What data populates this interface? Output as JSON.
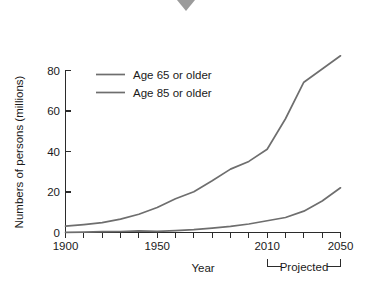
{
  "marker": {
    "name": "down-triangle-marker",
    "color": "#9b9b9b"
  },
  "chart_data": {
    "type": "line",
    "title": "",
    "xlabel": "Year",
    "ylabel": "Numbers of persons (millions)",
    "xlim": [
      1900,
      2050
    ],
    "ylim": [
      0,
      90
    ],
    "grid": false,
    "legend_position": "top-left-inside",
    "x_ticks_major": [
      1900,
      1950,
      2010,
      2050
    ],
    "x_tick_labels": [
      "1900",
      "1950",
      "2010",
      "2050"
    ],
    "x_ticks_minor_step": 10,
    "y_ticks": [
      0,
      20,
      40,
      60,
      80
    ],
    "y_tick_labels": [
      "0",
      "20",
      "40",
      "60",
      "80"
    ],
    "annotation": {
      "text": "Projected",
      "x_start": 2010,
      "x_end": 2050
    },
    "series": [
      {
        "name": "Age 65 or older",
        "color": "#6e6e6e",
        "x": [
          1900,
          1910,
          1920,
          1930,
          1940,
          1950,
          1960,
          1970,
          1980,
          1990,
          2000,
          2010,
          2020,
          2030,
          2040,
          2050
        ],
        "values": [
          3.1,
          3.9,
          4.9,
          6.6,
          9.0,
          12.3,
          16.6,
          20.1,
          25.5,
          31.2,
          35.0,
          41.0,
          56.0,
          74.0,
          80.5,
          87.0
        ]
      },
      {
        "name": "Age 85 or older",
        "color": "#6e6e6e",
        "x": [
          1900,
          1910,
          1920,
          1930,
          1940,
          1950,
          1960,
          1970,
          1980,
          1990,
          2000,
          2010,
          2020,
          2030,
          2040,
          2050
        ],
        "values": [
          0.1,
          0.2,
          0.4,
          0.5,
          0.8,
          0.6,
          0.9,
          1.4,
          2.2,
          3.0,
          4.2,
          5.8,
          7.4,
          10.5,
          15.5,
          22.0
        ]
      }
    ]
  }
}
